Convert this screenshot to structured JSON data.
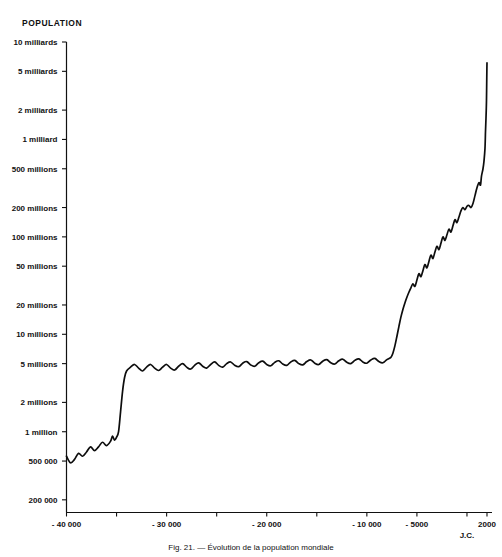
{
  "chart": {
    "title": "POPULATION",
    "caption": "Fig. 21. — Évolution de la population mondiale",
    "jc_marker": "J.C."
  },
  "chart_data": {
    "type": "line",
    "title": "POPULATION",
    "xlabel": "",
    "ylabel": "POPULATION",
    "scale": "log-y",
    "grid": false,
    "legend": null,
    "xlim": [
      -40000,
      2500
    ],
    "ylim": [
      150000,
      10000000000
    ],
    "xticks": [
      -40000,
      -35000,
      -30000,
      -25000,
      -20000,
      -15000,
      -10000,
      -5000,
      0,
      2000
    ],
    "xtick_labels": [
      "- 40 000",
      "",
      "- 30 000",
      "",
      "- 20 000",
      "",
      "- 10 000",
      "- 5000",
      "",
      "2000"
    ],
    "yticks": [
      200000,
      500000,
      1000000,
      2000000,
      5000000,
      10000000,
      20000000,
      50000000,
      100000000,
      200000000,
      500000000,
      1000000000,
      2000000000,
      5000000000,
      10000000000
    ],
    "ytick_labels": [
      "200 000",
      "500 000",
      "1 million",
      "2 millions",
      "5 millions",
      "10 millions",
      "20 millions",
      "50 millions",
      "100 millions",
      "200 millions",
      "500 millions",
      "1 milliard",
      "2 milliards",
      "5 milliards",
      "10 milliards"
    ],
    "series": [
      {
        "name": "Population mondiale",
        "x": [
          -40000,
          -39600,
          -39200,
          -38800,
          -38400,
          -38000,
          -37600,
          -37200,
          -36800,
          -36400,
          -36000,
          -35600,
          -35400,
          -35200,
          -35000,
          -34800,
          -34600,
          -34400,
          -34200,
          -34000,
          -33600,
          -33200,
          -32800,
          -32400,
          -32000,
          -31600,
          -31200,
          -30800,
          -30400,
          -30000,
          -29600,
          -29200,
          -28800,
          -28400,
          -28000,
          -27600,
          -27200,
          -26800,
          -26400,
          -26000,
          -25600,
          -25200,
          -24800,
          -24400,
          -24000,
          -23600,
          -23200,
          -22800,
          -22400,
          -22000,
          -21600,
          -21200,
          -20800,
          -20400,
          -20000,
          -19600,
          -19200,
          -18800,
          -18400,
          -18000,
          -17600,
          -17200,
          -16800,
          -16400,
          -16000,
          -15600,
          -15200,
          -14800,
          -14400,
          -14000,
          -13600,
          -13200,
          -12800,
          -12400,
          -12000,
          -11600,
          -11200,
          -10800,
          -10400,
          -10000,
          -9600,
          -9200,
          -8800,
          -8400,
          -8000,
          -7600,
          -7400,
          -7200,
          -7000,
          -6800,
          -6600,
          -6400,
          -6200,
          -6000,
          -5800,
          -5600,
          -5400,
          -5200,
          -5000,
          -4800,
          -4600,
          -4400,
          -4200,
          -4000,
          -3800,
          -3600,
          -3400,
          -3200,
          -3000,
          -2800,
          -2600,
          -2400,
          -2200,
          -2000,
          -1800,
          -1600,
          -1400,
          -1200,
          -1000,
          -800,
          -600,
          -400,
          -200,
          0,
          200,
          400,
          600,
          800,
          1000,
          1200,
          1350,
          1450,
          1600,
          1700,
          1800,
          1850,
          1900,
          1930,
          1950,
          1970,
          1990,
          2000
        ],
        "y": [
          560000,
          480000,
          520000,
          600000,
          560000,
          620000,
          700000,
          640000,
          700000,
          780000,
          720000,
          800000,
          900000,
          820000,
          880000,
          1000000,
          1600000,
          2600000,
          3600000,
          4200000,
          4600000,
          4900000,
          4500000,
          4200000,
          4600000,
          4900000,
          4500000,
          4250000,
          4600000,
          4900000,
          4500000,
          4300000,
          4700000,
          5000000,
          4600000,
          4400000,
          4800000,
          5100000,
          4700000,
          4500000,
          4900000,
          5200000,
          4800000,
          4600000,
          5000000,
          5200000,
          4800000,
          4650000,
          5050000,
          5250000,
          4850000,
          4700000,
          5100000,
          5300000,
          4900000,
          4750000,
          5150000,
          5350000,
          4950000,
          4800000,
          5200000,
          5400000,
          5000000,
          4850000,
          5250000,
          5450000,
          5050000,
          4900000,
          5300000,
          5500000,
          5100000,
          4950000,
          5350000,
          5550000,
          5150000,
          5000000,
          5400000,
          5600000,
          5200000,
          5050000,
          5450000,
          5650000,
          5250000,
          5100000,
          5500000,
          5800000,
          6400000,
          7600000,
          9500000,
          12000000,
          15000000,
          18000000,
          21000000,
          24000000,
          27000000,
          30000000,
          33000000,
          31000000,
          36000000,
          42000000,
          39000000,
          45000000,
          52000000,
          48000000,
          56000000,
          65000000,
          60000000,
          70000000,
          80000000,
          74000000,
          86000000,
          100000000,
          92000000,
          105000000,
          120000000,
          112000000,
          130000000,
          150000000,
          140000000,
          160000000,
          185000000,
          200000000,
          190000000,
          206000000,
          210000000,
          200000000,
          220000000,
          265000000,
          320000000,
          360000000,
          340000000,
          420000000,
          500000000,
          600000000,
          810000000,
          1200000000,
          1650000000,
          2070000000,
          2520000000,
          3700000000,
          5300000000,
          6100000000
        ]
      }
    ]
  }
}
